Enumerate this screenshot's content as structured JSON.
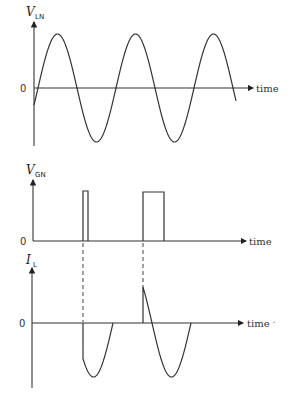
{
  "figure": {
    "panels": [
      {
        "id": "vln",
        "ylabel_main": "V",
        "ylabel_sub": "LN",
        "zero_label": "0",
        "xlabel": "time",
        "description": "Line-to-neutral AC voltage, sinusoid over ~2.5 cycles"
      },
      {
        "id": "vgn",
        "ylabel_main": "V",
        "ylabel_sub": "GN",
        "zero_label": "0",
        "xlabel": "time",
        "description": "Gate trigger pulses: a narrow pulse in the first cycle, a wider pulse in the second cycle"
      },
      {
        "id": "il",
        "ylabel_main": "I",
        "ylabel_sub": "L",
        "zero_label": "0",
        "xlabel": "time",
        "xlabel_suffix": "-",
        "description": "Load current flowing only after gate triggering, until the next zero crossing"
      }
    ]
  }
}
